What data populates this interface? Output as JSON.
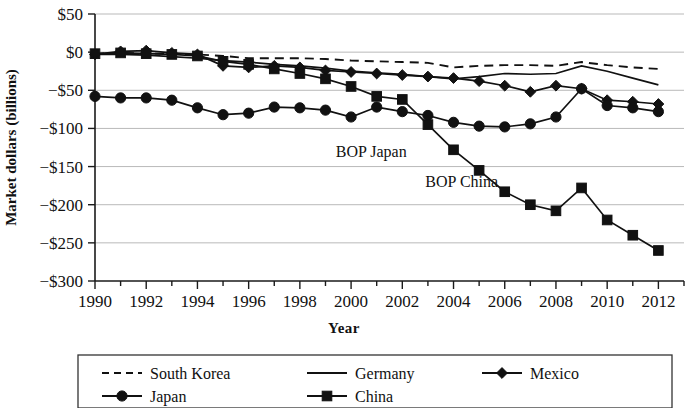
{
  "chart_data": {
    "type": "line",
    "title": "",
    "xlabel": "Year",
    "ylabel": "Market dollars (billions)",
    "xlim": [
      1990,
      2013
    ],
    "ylim": [
      -300,
      50
    ],
    "ytick_labels": [
      "$50",
      "$0",
      "−$50",
      "−$100",
      "−$150",
      "−$200",
      "−$250",
      "−$300"
    ],
    "ytick_values": [
      50,
      0,
      -50,
      -100,
      -150,
      -200,
      -250,
      -300
    ],
    "xtick_labels": [
      "1990",
      "1992",
      "1994",
      "1996",
      "1998",
      "2000",
      "2002",
      "2004",
      "2006",
      "2008",
      "2010",
      "2012"
    ],
    "xtick_values": [
      1990,
      1992,
      1994,
      1996,
      1998,
      2000,
      2002,
      2004,
      2006,
      2008,
      2010,
      2012
    ],
    "grid": "horizontal",
    "legend_position": "bottom",
    "x": [
      1990,
      1991,
      1992,
      1993,
      1994,
      1995,
      1996,
      1997,
      1998,
      1999,
      2000,
      2001,
      2002,
      2003,
      2004,
      2005,
      2006,
      2007,
      2008,
      2009,
      2010,
      2011,
      2012
    ],
    "series": [
      {
        "name": "South Korea",
        "style": "dashed",
        "marker": "none",
        "values": [
          -2,
          -1,
          -2,
          -2,
          -3,
          -5,
          -8,
          -8,
          -8,
          -9,
          -11,
          -12,
          -13,
          -14,
          -20,
          -18,
          -17,
          -17,
          -18,
          -13,
          -17,
          -20,
          -22
        ]
      },
      {
        "name": "Germany",
        "style": "solid",
        "marker": "none",
        "values": [
          -3,
          -3,
          -4,
          -6,
          -8,
          -11,
          -13,
          -16,
          -18,
          -21,
          -25,
          -27,
          -29,
          -32,
          -35,
          -32,
          -28,
          -29,
          -28,
          -18,
          -25,
          -34,
          -43
        ]
      },
      {
        "name": "Mexico",
        "style": "solid",
        "marker": "diamond",
        "values": [
          -3,
          1,
          2,
          -1,
          -3,
          -18,
          -20,
          -18,
          -20,
          -24,
          -26,
          -28,
          -30,
          -32,
          -34,
          -38,
          -44,
          -52,
          -44,
          -48,
          -63,
          -65,
          -68
        ]
      },
      {
        "name": "Japan",
        "style": "solid",
        "marker": "circle",
        "values": [
          -58,
          -60,
          -60,
          -63,
          -73,
          -82,
          -80,
          -72,
          -73,
          -76,
          -85,
          -72,
          -78,
          -83,
          -92,
          -97,
          -98,
          -94,
          -85,
          -48,
          -70,
          -73,
          -78
        ]
      },
      {
        "name": "China",
        "style": "solid",
        "marker": "square",
        "values": [
          -2,
          -1,
          -2,
          -3,
          -5,
          -12,
          -16,
          -22,
          -28,
          -35,
          -45,
          -58,
          -62,
          -95,
          -128,
          -155,
          -183,
          -200,
          -208,
          -178,
          -220,
          -240,
          -260
        ]
      }
    ],
    "annotations": [
      {
        "text": "BOP Japan",
        "x": 1999.4,
        "y": -137,
        "anchor": "start"
      },
      {
        "text": "BOP China",
        "x": 2002.9,
        "y": -177,
        "anchor": "start"
      }
    ],
    "legend_entries": [
      {
        "label": "South Korea",
        "style": "dashed",
        "marker": "none"
      },
      {
        "label": "Germany",
        "style": "solid",
        "marker": "none"
      },
      {
        "label": "Mexico",
        "style": "solid",
        "marker": "diamond"
      },
      {
        "label": "Japan",
        "style": "solid",
        "marker": "circle"
      },
      {
        "label": "China",
        "style": "solid",
        "marker": "square"
      }
    ]
  }
}
